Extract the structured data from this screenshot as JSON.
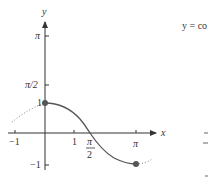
{
  "figure": {
    "caption_partial": "y = co",
    "axis_labels": {
      "x": "x",
      "y": "y"
    },
    "x_ticks": [
      {
        "label": "−1",
        "value": -1
      },
      {
        "label": "1",
        "value": 1
      },
      {
        "label_num": "π",
        "label_den": "2",
        "value": 1.5708
      },
      {
        "label": "π",
        "value": 3.1416
      }
    ],
    "y_ticks": [
      {
        "label": "π",
        "value": 3.1416
      },
      {
        "label": "π/2",
        "value": 1.5708
      },
      {
        "label": "1",
        "value": 1
      },
      {
        "label": "−1",
        "value": -1
      }
    ],
    "curve": {
      "function": "cos x",
      "solid_domain": [
        0,
        3.1416
      ],
      "dotted_extensions": [
        [
          -1,
          0
        ],
        [
          3.1416,
          3.4
        ]
      ],
      "endpoints": [
        [
          0,
          1
        ],
        [
          3.1416,
          -1
        ]
      ],
      "color": "#555555"
    },
    "colors": {
      "axis": "#333333",
      "curve": "#555555",
      "point": "#555555",
      "dots": "#888888"
    }
  }
}
